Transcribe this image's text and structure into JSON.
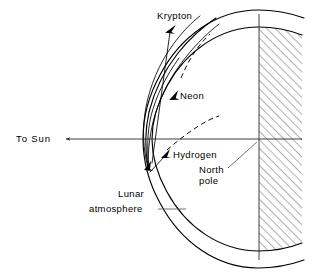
{
  "figure": {
    "type": "scientific-diagram",
    "background_color": "#ffffff",
    "line_color": "#000000",
    "axis_color": "#2b2b2b",
    "leader_color": "#5a5a5a"
  },
  "labels": {
    "krypton": "Krypton",
    "neon": "Neon",
    "hydrogen": "Hydrogen",
    "to_sun": "To Sun",
    "north_pole_line1": "North",
    "north_pole_line2": "pole",
    "lunar_atmosphere_line1": "Lunar",
    "lunar_atmosphere_line2": "atmosphere"
  },
  "elements": {
    "moon_surface_arc": "moon-surface-arc",
    "atmosphere_outer_arc": "atmosphere-outer-arc",
    "hatched_moon_body": "hatched-moon-interior",
    "vertical_polar_axis": "polar-axis",
    "horizontal_sun_axis": "sun-axis",
    "sun_arrow": "to-sun-arrow",
    "krypton_trajectory": "krypton-trajectory-curve",
    "neon_trajectory": "neon-trajectory-curve",
    "hydrogen_trajectory": "hydrogen-trajectory-curve",
    "dashed_trajectory_upper": "dashed-trajectory-upper",
    "dashed_trajectory_lower": "dashed-trajectory-lower"
  },
  "geometry": {
    "polar_axis_x": 259,
    "sun_axis_y": 139,
    "convergence_point": {
      "x": 148,
      "y": 167
    },
    "hatch_right_edge": 299,
    "hatch_angle_deg": 45
  }
}
